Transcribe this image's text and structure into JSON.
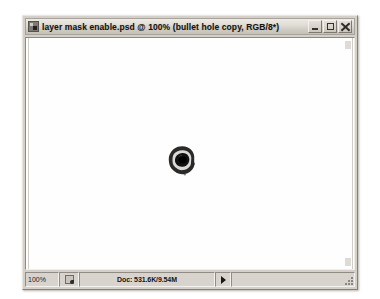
{
  "window": {
    "title": "layer mask enable.psd @ 100% (bullet hole copy, RGB/8*)",
    "document_icon": "photoshop-document-icon",
    "controls": {
      "minimize_label": "Minimize",
      "maximize_label": "Maximize",
      "close_label": "Close"
    }
  },
  "canvas": {
    "background_color": "#ffffff",
    "artwork_name": "bullet-hole",
    "artwork_colors": {
      "ring": "#1b1917",
      "center": "#000000",
      "halo": "#6b6762"
    }
  },
  "status_bar": {
    "zoom_level": "100%",
    "thumbnail_icon": "document-preview-icon",
    "doc_info": "Doc: 531.6K/9.54M",
    "popup_arrow_icon": "popup-menu-arrow-icon",
    "resize_grip_icon": "resize-grip-icon"
  }
}
